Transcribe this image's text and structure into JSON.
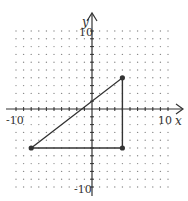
{
  "chart_data": {
    "type": "scatter",
    "title": "",
    "xlabel": "x",
    "ylabel": "y",
    "xlim": [
      -10,
      10
    ],
    "ylim": [
      -10,
      10
    ],
    "grid": "dots",
    "tick_labels": {
      "x_min": "-10",
      "x_max": "10",
      "y_max": "10",
      "y_min": "-10"
    },
    "series": [
      {
        "name": "triangle",
        "closed": true,
        "points": [
          {
            "x": -8,
            "y": -5
          },
          {
            "x": 4,
            "y": 4
          },
          {
            "x": 4,
            "y": -5
          }
        ]
      }
    ]
  },
  "colors": {
    "line": "#333333",
    "grid_dot": "#8a8a8a",
    "axis": "#333333"
  }
}
